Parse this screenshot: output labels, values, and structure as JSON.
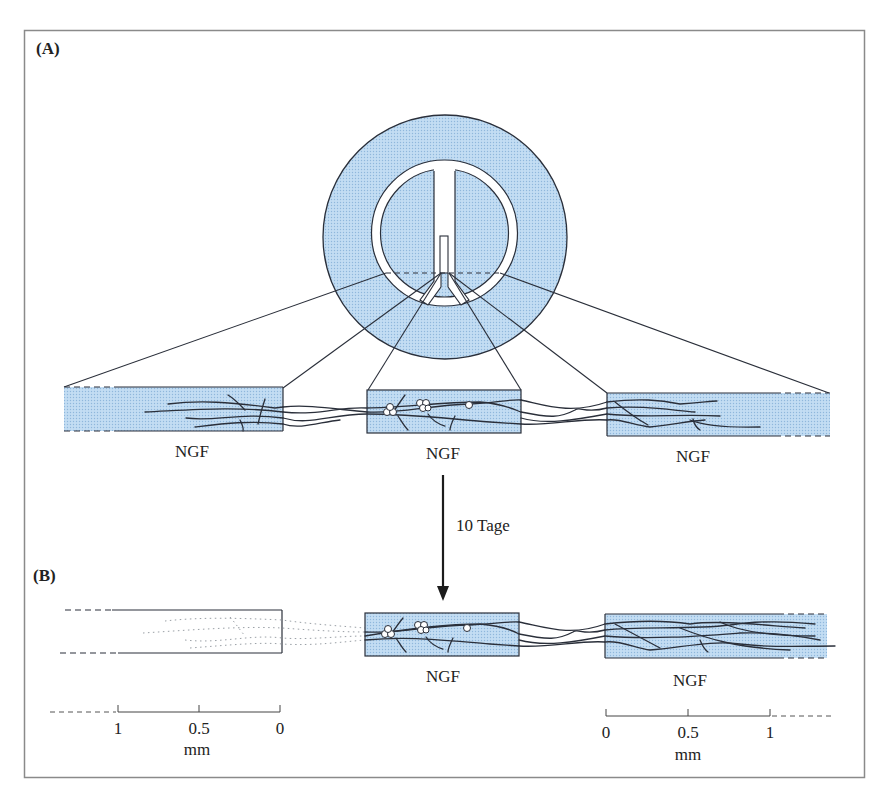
{
  "figure": {
    "panels": [
      {
        "id": "A",
        "label": "(A)"
      },
      {
        "id": "B",
        "label": "(B)"
      }
    ],
    "colors": {
      "fill_blue": "#b4d3ee",
      "stroke": "#2a2f3a",
      "frame": "#8a8a8a",
      "background": "#ffffff"
    },
    "panel_a": {
      "compartments": [
        {
          "name": "left",
          "label": "NGF"
        },
        {
          "name": "center",
          "label": "NGF"
        },
        {
          "name": "right",
          "label": "NGF"
        }
      ]
    },
    "arrow": {
      "label": "10 Tage"
    },
    "panel_b": {
      "compartments": [
        {
          "name": "left",
          "label": ""
        },
        {
          "name": "center",
          "label": "NGF"
        },
        {
          "name": "right",
          "label": "NGF"
        }
      ]
    },
    "scales": {
      "left": {
        "ticks": [
          "1",
          "0.5",
          "0"
        ],
        "unit": "mm"
      },
      "right": {
        "ticks": [
          "0",
          "0.5",
          "1"
        ],
        "unit": "mm"
      }
    }
  }
}
